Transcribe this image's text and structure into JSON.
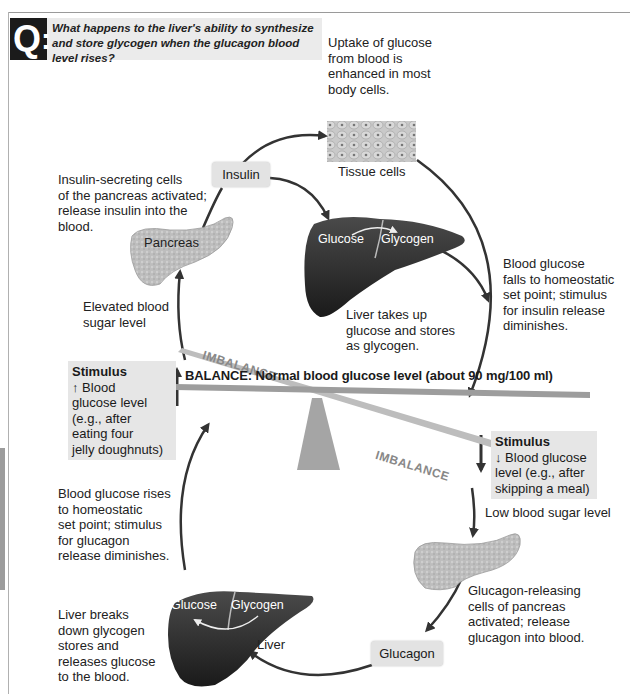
{
  "question": {
    "badge": "Q",
    "text": "What happens to the liver's ability to synthesize and store glycogen when the glucagon blood level rises?"
  },
  "top_loop": {
    "uptake_text": [
      "Uptake of glucose",
      "from blood is",
      "enhanced in most",
      "body cells."
    ],
    "tissue_label": "Tissue cells",
    "insulin_label": "Insulin",
    "insulin_cells_text": [
      "Insulin-secreting cells",
      "of the pancreas activated;",
      "release insulin into the",
      "blood."
    ],
    "pancreas_label": "Pancreas",
    "liver_glucose": "Glucose",
    "liver_glycogen": "Glycogen",
    "liver_text": [
      "Liver takes up",
      "glucose and stores",
      "as glycogen."
    ],
    "falls_text": [
      "Blood glucose",
      "falls to homeostatic",
      "set point; stimulus",
      "for insulin release",
      "diminishes."
    ],
    "elevated_text": [
      "Elevated blood",
      "sugar level"
    ]
  },
  "balance": {
    "label": "BALANCE: Normal blood glucose level (about 90 mg/100 ml)",
    "imbalance_top": "IMBALANCE",
    "imbalance_bottom": "IMBALANCE"
  },
  "stimulus_up": {
    "title": "Stimulus",
    "lines": [
      "↑ Blood",
      "glucose level",
      "(e.g., after",
      "eating four",
      "jelly doughnuts)"
    ]
  },
  "stimulus_down": {
    "title": "Stimulus",
    "lines": [
      "↓ Blood glucose",
      "level (e.g., after",
      "skipping a meal)"
    ]
  },
  "bottom_loop": {
    "low_text": "Low blood sugar level",
    "glucagon_cells_text": [
      "Glucagon-releasing",
      "cells of pancreas",
      "activated; release",
      "glucagon into blood."
    ],
    "glucagon_label": "Glucagon",
    "liver_label": "Liver",
    "liver_glucose": "Glucose",
    "liver_glycogen": "Glycogen",
    "liver_text": [
      "Liver breaks",
      "down glycogen",
      "stores and",
      "releases glucose",
      "to the blood."
    ],
    "rises_text": [
      "Blood glucose rises",
      "to homeostatic",
      "set point; stimulus",
      "for glucagon",
      "release diminishes."
    ]
  },
  "colors": {
    "arrow": "#333333",
    "liver": "#2a2a2a",
    "pancreas": "#b8b8b8",
    "label_bg": "#e3e3e3",
    "seesaw": "#a8a8a8"
  }
}
